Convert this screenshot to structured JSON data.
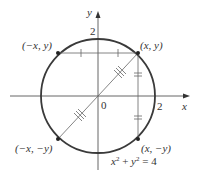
{
  "diagram": {
    "axes": {
      "x_label": "x",
      "y_label": "y",
      "origin_label": "0"
    },
    "tick_labels": {
      "x_two": "2",
      "y_two": "2"
    },
    "points": {
      "q1": "(x, y)",
      "q2": "(−x, y)",
      "q3": "(−x, −y)",
      "q4": "(x, −y)"
    },
    "equation": {
      "base_x": "x",
      "exp_x": "2",
      "plus": " + ",
      "base_y": "y",
      "exp_y": "2",
      "rhs": " = 4"
    },
    "colors": {
      "circle": "#3a3a3a",
      "axis": "#555555",
      "line": "#666666"
    }
  }
}
